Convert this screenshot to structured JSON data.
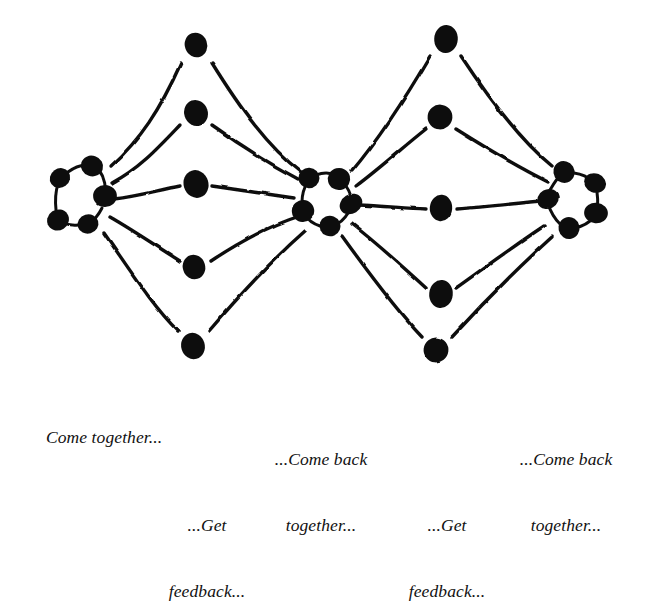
{
  "diagram": {
    "type": "node-cluster-divergence-convergence",
    "background_color": "#ffffff",
    "ink_color": "#111111",
    "clusters": [
      {
        "id": "cluster-left",
        "label": "left-team-cluster",
        "center": [
          83,
          196
        ],
        "radius": 30,
        "dot_count": 5,
        "dots": [
          [
            60,
            178
          ],
          [
            92,
            166
          ],
          [
            105,
            196
          ],
          [
            88,
            224
          ],
          [
            58,
            220
          ]
        ]
      },
      {
        "id": "cluster-middle",
        "label": "middle-team-cluster",
        "center": [
          328,
          197
        ],
        "radius": 28,
        "dot_count": 5,
        "dots": [
          [
            309,
            178
          ],
          [
            339,
            179
          ],
          [
            351,
            204
          ],
          [
            330,
            226
          ],
          [
            303,
            211
          ]
        ]
      },
      {
        "id": "cluster-right",
        "label": "right-team-cluster",
        "center": [
          575,
          198
        ],
        "radius": 29,
        "dot_count": 5,
        "dots": [
          [
            564,
            172
          ],
          [
            595,
            183
          ],
          [
            596,
            213
          ],
          [
            569,
            228
          ],
          [
            548,
            199
          ]
        ]
      }
    ],
    "columns": [
      {
        "id": "column-left",
        "label": "first-feedback-column",
        "x": 196,
        "dot_count": 5,
        "dots": [
          [
            196,
            45
          ],
          [
            196,
            113
          ],
          [
            196,
            184
          ],
          [
            194,
            267
          ],
          [
            193,
            346
          ]
        ]
      },
      {
        "id": "column-right",
        "label": "second-feedback-column",
        "x": 443,
        "dot_count": 5,
        "dots": [
          [
            446,
            39
          ],
          [
            440,
            117
          ],
          [
            441,
            208
          ],
          [
            441,
            294
          ],
          [
            436,
            350
          ]
        ]
      }
    ],
    "edge_count": 20,
    "edge_description": "Each column dot connects by a hand-drawn stroke to the cluster on its left and the cluster on its right."
  },
  "captions": [
    {
      "id": "caption-come-together",
      "name": "caption-come-together",
      "lines": [
        "Come together..."
      ],
      "text": "Come together...",
      "x": 28,
      "y": 404,
      "align": "left"
    },
    {
      "id": "caption-get-feedback-1",
      "name": "caption-get-feedback-first",
      "lines": [
        "...Get",
        "feedback..."
      ],
      "text": "...Get feedback...",
      "x": 207,
      "y": 470,
      "align": "center"
    },
    {
      "id": "caption-come-back-together-1",
      "name": "caption-come-back-together-first",
      "lines": [
        "...Come back",
        "together..."
      ],
      "text": "...Come back together...",
      "x": 321,
      "y": 404,
      "align": "center"
    },
    {
      "id": "caption-get-feedback-2",
      "name": "caption-get-feedback-second",
      "lines": [
        "...Get",
        "feedback..."
      ],
      "text": "...Get feedback...",
      "x": 447,
      "y": 470,
      "align": "center"
    },
    {
      "id": "caption-come-back-together-2",
      "name": "caption-come-back-together-second",
      "lines": [
        "...Come back",
        "together..."
      ],
      "text": "...Come back together...",
      "x": 566,
      "y": 404,
      "align": "center"
    }
  ]
}
